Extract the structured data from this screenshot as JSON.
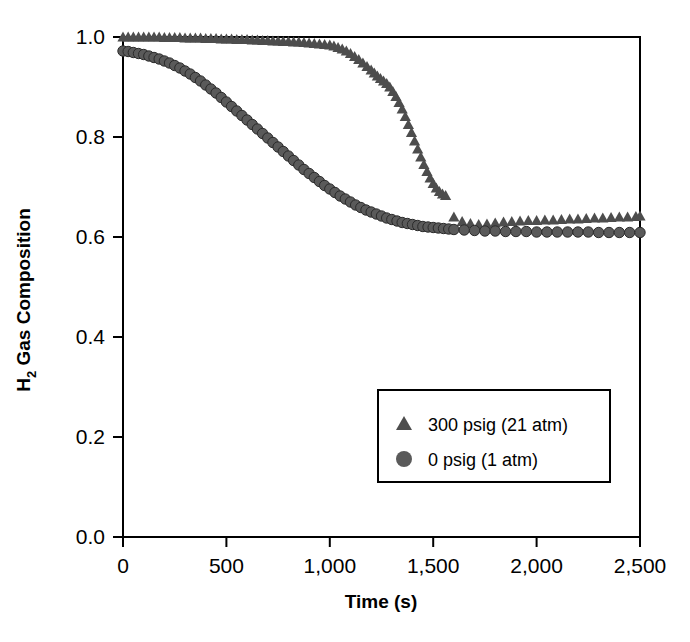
{
  "chart_data": {
    "type": "scatter",
    "title": "",
    "xlabel": "Time (s)",
    "ylabel": "H2 Gas Composition",
    "ylabel_main": "H",
    "ylabel_sub": "2",
    "ylabel_rest": " Gas Composition",
    "xlim": [
      0,
      2500
    ],
    "ylim": [
      0.0,
      1.0
    ],
    "xticks": [
      0,
      500,
      1000,
      1500,
      2000,
      2500
    ],
    "xtick_labels": [
      "0",
      "500",
      "1,000",
      "1,500",
      "2,000",
      "2,500"
    ],
    "yticks": [
      0.0,
      0.2,
      0.4,
      0.6,
      0.8,
      1.0
    ],
    "ytick_labels": [
      "0.0",
      "0.2",
      "0.4",
      "0.6",
      "0.8",
      "1.0"
    ],
    "grid": false,
    "legend_position": "lower-center-right",
    "marker_color": "#555555",
    "frame_color": "#000000",
    "series": [
      {
        "name": "300 psig (21 atm)",
        "marker": "triangle",
        "color": "#4d4d4d",
        "x": [
          0,
          25,
          50,
          75,
          100,
          125,
          150,
          175,
          200,
          225,
          250,
          275,
          300,
          325,
          350,
          375,
          400,
          425,
          450,
          475,
          500,
          525,
          550,
          575,
          600,
          625,
          650,
          675,
          700,
          725,
          750,
          775,
          800,
          825,
          850,
          875,
          900,
          925,
          950,
          975,
          1000,
          1020,
          1040,
          1060,
          1080,
          1100,
          1120,
          1140,
          1160,
          1180,
          1200,
          1215,
          1230,
          1245,
          1260,
          1275,
          1290,
          1305,
          1320,
          1335,
          1350,
          1365,
          1380,
          1395,
          1410,
          1425,
          1440,
          1455,
          1470,
          1485,
          1500,
          1515,
          1530,
          1545,
          1560,
          1600,
          1640,
          1680,
          1720,
          1760,
          1800,
          1840,
          1880,
          1920,
          1960,
          2000,
          2040,
          2080,
          2120,
          2160,
          2200,
          2240,
          2280,
          2320,
          2360,
          2400,
          2440,
          2480,
          2500
        ],
        "y": [
          1.0,
          1.0,
          1.0,
          1.0,
          1.0,
          1.0,
          1.0,
          1.0,
          0.999,
          0.999,
          0.999,
          0.999,
          0.998,
          0.998,
          0.998,
          0.998,
          0.997,
          0.997,
          0.997,
          0.996,
          0.996,
          0.996,
          0.995,
          0.995,
          0.995,
          0.994,
          0.994,
          0.993,
          0.993,
          0.992,
          0.992,
          0.991,
          0.991,
          0.99,
          0.99,
          0.989,
          0.988,
          0.987,
          0.986,
          0.985,
          0.984,
          0.982,
          0.979,
          0.976,
          0.972,
          0.967,
          0.961,
          0.955,
          0.948,
          0.941,
          0.934,
          0.928,
          0.922,
          0.917,
          0.912,
          0.907,
          0.9,
          0.891,
          0.881,
          0.869,
          0.856,
          0.841,
          0.825,
          0.809,
          0.792,
          0.776,
          0.76,
          0.745,
          0.731,
          0.718,
          0.707,
          0.698,
          0.691,
          0.686,
          0.683,
          0.64,
          0.631,
          0.627,
          0.625,
          0.626,
          0.628,
          0.63,
          0.631,
          0.632,
          0.633,
          0.633,
          0.634,
          0.634,
          0.635,
          0.636,
          0.636,
          0.637,
          0.638,
          0.638,
          0.639,
          0.64,
          0.64,
          0.641,
          0.642
        ]
      },
      {
        "name": "0 psig (1 atm)",
        "marker": "circle",
        "color": "#5a5a5a",
        "x": [
          0,
          25,
          50,
          75,
          100,
          125,
          150,
          175,
          200,
          225,
          250,
          275,
          300,
          325,
          350,
          375,
          400,
          425,
          450,
          475,
          500,
          525,
          550,
          575,
          600,
          625,
          650,
          675,
          700,
          725,
          750,
          775,
          800,
          825,
          850,
          875,
          900,
          925,
          950,
          975,
          1000,
          1025,
          1050,
          1075,
          1100,
          1125,
          1150,
          1175,
          1200,
          1225,
          1250,
          1275,
          1300,
          1325,
          1350,
          1375,
          1400,
          1425,
          1450,
          1475,
          1500,
          1525,
          1550,
          1575,
          1600,
          1650,
          1700,
          1750,
          1800,
          1850,
          1900,
          1950,
          2000,
          2050,
          2100,
          2150,
          2200,
          2250,
          2300,
          2350,
          2400,
          2450,
          2500
        ],
        "y": [
          0.972,
          0.971,
          0.969,
          0.967,
          0.965,
          0.962,
          0.959,
          0.956,
          0.952,
          0.948,
          0.943,
          0.938,
          0.932,
          0.926,
          0.919,
          0.912,
          0.904,
          0.896,
          0.888,
          0.879,
          0.87,
          0.861,
          0.852,
          0.843,
          0.834,
          0.825,
          0.816,
          0.807,
          0.798,
          0.789,
          0.78,
          0.771,
          0.762,
          0.753,
          0.744,
          0.735,
          0.727,
          0.719,
          0.711,
          0.703,
          0.696,
          0.689,
          0.682,
          0.676,
          0.67,
          0.664,
          0.659,
          0.654,
          0.65,
          0.646,
          0.642,
          0.638,
          0.635,
          0.632,
          0.629,
          0.627,
          0.625,
          0.623,
          0.621,
          0.62,
          0.619,
          0.618,
          0.617,
          0.616,
          0.615,
          0.614,
          0.613,
          0.612,
          0.612,
          0.611,
          0.611,
          0.611,
          0.61,
          0.61,
          0.61,
          0.61,
          0.61,
          0.61,
          0.609,
          0.609,
          0.609,
          0.609,
          0.609
        ]
      }
    ],
    "legend": [
      {
        "label": "300 psig (21 atm)",
        "marker": "triangle"
      },
      {
        "label": "0 psig (1 atm)",
        "marker": "circle"
      }
    ]
  }
}
